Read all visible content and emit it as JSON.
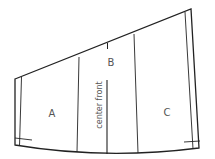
{
  "diagram": {
    "type": "sewing-pattern-piece",
    "labels": {
      "a": "A",
      "b": "B",
      "c": "C",
      "center_front": "center front"
    },
    "colors": {
      "line": "#222222",
      "text": "#555555",
      "background": "#ffffff"
    }
  }
}
